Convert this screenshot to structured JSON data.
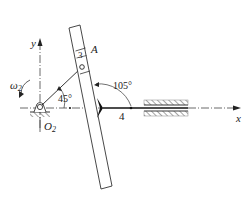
{
  "diagram": {
    "type": "slotted-link mechanism",
    "axes": {
      "x_label": "x",
      "y_label": "y"
    },
    "points": {
      "pivot": "O",
      "pivot_sub": "2",
      "pin": "A"
    },
    "links": {
      "slider_block": "3",
      "slotted_bar_joint": "4"
    },
    "angular_velocity": {
      "symbol": "ω",
      "sub": "2"
    },
    "angles": {
      "crank_angle": "45°",
      "bar_angle": "105°"
    },
    "colors": {
      "line": "#333333",
      "hatch": "#777777",
      "background": "#ffffff"
    }
  }
}
